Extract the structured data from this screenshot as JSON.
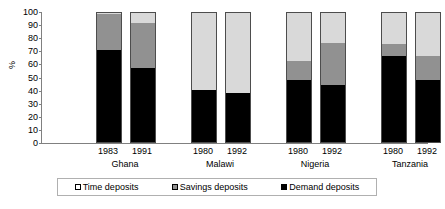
{
  "chart_data": {
    "type": "bar",
    "subtype": "stacked-percent",
    "title": "",
    "xlabel": "",
    "ylabel": "%",
    "ylim": [
      0,
      100
    ],
    "yticks": [
      100,
      90,
      80,
      70,
      60,
      50,
      40,
      30,
      20,
      10,
      0
    ],
    "grid": false,
    "legend_position": "bottom",
    "categories": [
      "1983",
      "1991",
      "1980",
      "1992",
      "1980",
      "1992",
      "1980",
      "1992"
    ],
    "groups": [
      {
        "name": "Ghana",
        "years": [
          "1983",
          "1991"
        ]
      },
      {
        "name": "Malawi",
        "years": [
          "1980",
          "1992"
        ]
      },
      {
        "name": "Nigeria",
        "years": [
          "1980",
          "1992"
        ]
      },
      {
        "name": "Tanzania",
        "years": [
          "1980",
          "1992"
        ]
      }
    ],
    "series": [
      {
        "name": "Demand deposits",
        "color": "#000000",
        "values": [
          71,
          57,
          40,
          38,
          48,
          44,
          67,
          48
        ]
      },
      {
        "name": "Savings deposits",
        "color": "#919191",
        "values": [
          28,
          35,
          0,
          0,
          15,
          33,
          9,
          19
        ]
      },
      {
        "name": "Time deposits",
        "color": "#d9d9d9",
        "values": [
          1,
          8,
          60,
          62,
          37,
          23,
          24,
          33
        ]
      }
    ],
    "bars": [
      {
        "group": "Ghana",
        "year": "1983",
        "demand": 71,
        "savings": 28,
        "time": 1
      },
      {
        "group": "Ghana",
        "year": "1991",
        "demand": 57,
        "savings": 35,
        "time": 8
      },
      {
        "group": "Malawi",
        "year": "1980",
        "demand": 40,
        "savings": 0,
        "time": 60
      },
      {
        "group": "Malawi",
        "year": "1992",
        "demand": 38,
        "savings": 0,
        "time": 62
      },
      {
        "group": "Nigeria",
        "year": "1980",
        "demand": 48,
        "savings": 15,
        "time": 37
      },
      {
        "group": "Nigeria",
        "year": "1992",
        "demand": 44,
        "savings": 33,
        "time": 23
      },
      {
        "group": "Tanzania",
        "year": "1980",
        "demand": 67,
        "savings": 9,
        "time": 24
      },
      {
        "group": "Tanzania",
        "year": "1992",
        "demand": 48,
        "savings": 19,
        "time": 33
      }
    ]
  },
  "legend": {
    "items": [
      {
        "label": "Time deposits",
        "swatch": "time"
      },
      {
        "label": "Savings deposits",
        "swatch": "savings"
      },
      {
        "label": "Demand deposits",
        "swatch": "demand"
      }
    ]
  },
  "colors": {
    "demand": "#000000",
    "savings": "#919191",
    "time": "#d9d9d9",
    "axis": "#808080",
    "text": "#000000"
  }
}
